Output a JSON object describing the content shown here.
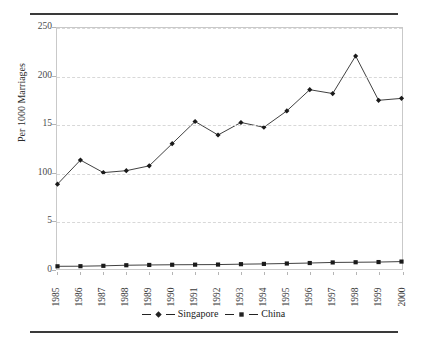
{
  "figure": {
    "masthead_fragment": "",
    "y_axis_title": "Per 1000 Marriages"
  },
  "legend": {
    "items": [
      {
        "label": "Singapore",
        "marker": "diamond-marker-icon",
        "color": "#222222"
      },
      {
        "label": "China",
        "marker": "square-marker-icon",
        "color": "#222222"
      }
    ]
  },
  "chart_data": {
    "type": "line",
    "title": "",
    "subtitle": "",
    "xlabel": "",
    "ylabel": "Per 1000 Marriages",
    "xlim": [
      1985,
      2000
    ],
    "ylim": [
      0,
      250
    ],
    "yticks": [
      0,
      50,
      100,
      150,
      200,
      250
    ],
    "ytick_labels": [
      "0",
      "5",
      "100",
      "15",
      "200",
      "250"
    ],
    "grid": "horizontal-dashed",
    "legend_position": "bottom-center",
    "categories": [
      "1985",
      "1986",
      "1987",
      "1988",
      "1989",
      "1990",
      "1991",
      "1992",
      "1993",
      "1994",
      "1995",
      "1996",
      "1997",
      "1998",
      "1999",
      "2000"
    ],
    "series": [
      {
        "name": "Singapore",
        "marker": "diamond",
        "values": [
          88,
          113,
          100,
          102,
          107,
          130,
          153,
          139,
          152,
          147,
          164,
          186,
          182,
          221,
          175,
          177
        ]
      },
      {
        "name": "China",
        "marker": "square",
        "values": [
          2.8,
          2.9,
          3.3,
          3.9,
          4.2,
          4.4,
          4.5,
          4.6,
          5.0,
          5.3,
          5.7,
          6.2,
          6.8,
          7.0,
          7.2,
          7.7
        ]
      }
    ]
  }
}
